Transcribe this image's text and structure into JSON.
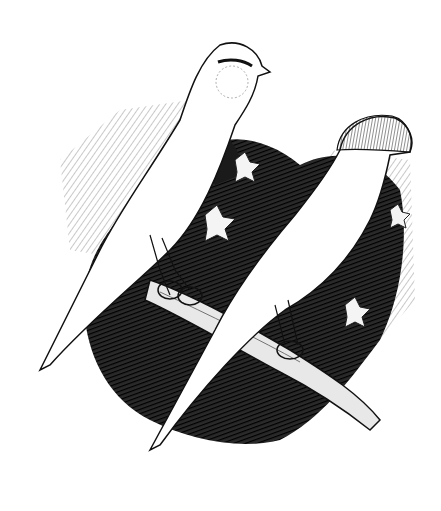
{
  "image": {
    "description": "Black-and-white engraving of two crested/plainhead canaries perched on a diagonal branch against dark foliage",
    "background_color": "#ffffff",
    "ink_color": "#111111",
    "subjects": [
      {
        "name": "plainhead canary",
        "position": "upper left"
      },
      {
        "name": "crested canary",
        "position": "lower right"
      }
    ],
    "elements": [
      "branch",
      "ivy leaves",
      "dark cross-hatched foliage"
    ]
  }
}
